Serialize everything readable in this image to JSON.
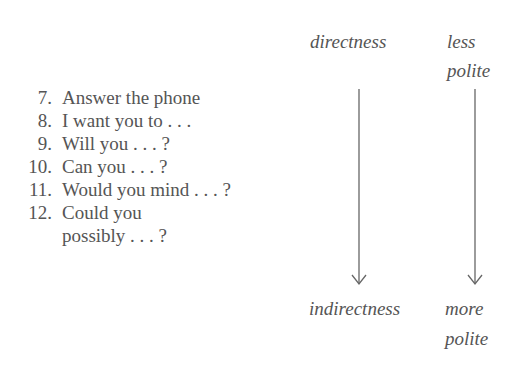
{
  "items": [
    {
      "number": "7.",
      "text": "Answer the phone"
    },
    {
      "number": "8.",
      "text": "I want you to . . ."
    },
    {
      "number": "9.",
      "text": "Will you . . . ?"
    },
    {
      "number": "10.",
      "text": "Can you . . . ?"
    },
    {
      "number": "11.",
      "text": "Would you mind . . . ?"
    },
    {
      "number": "12.",
      "text": "Could you",
      "continuation": "possibly . . . ?"
    }
  ],
  "scales": {
    "directness": {
      "top": "directness",
      "bottom": "indirectness"
    },
    "politeness": {
      "top_line1": "less",
      "top_line2": "polite",
      "bottom_line1": "more",
      "bottom_line2": "polite"
    }
  },
  "colors": {
    "text": "#555555",
    "arrow": "#666666"
  }
}
